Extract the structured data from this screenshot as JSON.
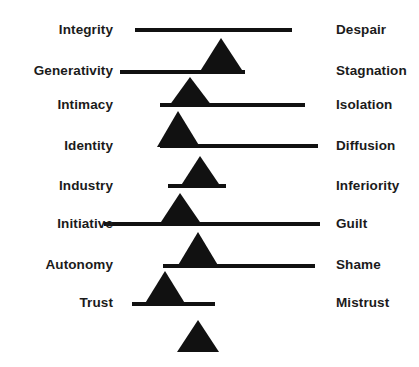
{
  "figure": {
    "background_color": "#ffffff",
    "ink_color": "#111111"
  },
  "rows": [
    {
      "left_label": "Integrity",
      "right_label": "Despair",
      "label_y": 30,
      "beam": {
        "x1": 135,
        "x2": 292,
        "y": 30,
        "thickness": 4
      },
      "fulcrum": null
    },
    {
      "left_label": "Generativity",
      "right_label": "Stagnation",
      "label_y": 71,
      "beam": {
        "x1": 120,
        "x2": 245,
        "y": 72,
        "thickness": 4
      },
      "fulcrum": {
        "apex_x": 221,
        "base_left": 199,
        "base_right": 244,
        "apex_y": 38,
        "base_y": 73
      }
    },
    {
      "left_label": "Intimacy",
      "right_label": "Isolation",
      "label_y": 105,
      "beam": {
        "x1": 160,
        "x2": 305,
        "y": 105,
        "thickness": 4
      },
      "fulcrum": {
        "apex_x": 190,
        "base_left": 169,
        "base_right": 212,
        "apex_y": 77,
        "base_y": 106
      }
    },
    {
      "left_label": "Identity",
      "right_label": "Diffusion",
      "label_y": 146,
      "beam": {
        "x1": 160,
        "x2": 318,
        "y": 146,
        "thickness": 4
      },
      "fulcrum": {
        "apex_x": 178,
        "base_left": 157,
        "base_right": 200,
        "apex_y": 111,
        "base_y": 147
      }
    },
    {
      "left_label": "Industry",
      "right_label": "Inferiority",
      "label_y": 186,
      "beam": {
        "x1": 168,
        "x2": 226,
        "y": 186,
        "thickness": 4
      },
      "fulcrum": {
        "apex_x": 200,
        "base_left": 180,
        "base_right": 221,
        "apex_y": 156,
        "base_y": 187
      }
    },
    {
      "left_label": "Initiative",
      "right_label": "Guilt",
      "label_y": 224,
      "beam": {
        "x1": 104,
        "x2": 320,
        "y": 224,
        "thickness": 4
      },
      "fulcrum": {
        "apex_x": 180,
        "base_left": 159,
        "base_right": 202,
        "apex_y": 193,
        "base_y": 225
      }
    },
    {
      "left_label": "Autonomy",
      "right_label": "Shame",
      "label_y": 265,
      "beam": {
        "x1": 163,
        "x2": 315,
        "y": 266,
        "thickness": 4
      },
      "fulcrum": {
        "apex_x": 198,
        "base_left": 177,
        "base_right": 219,
        "apex_y": 232,
        "base_y": 267
      }
    },
    {
      "left_label": "Trust",
      "right_label": "Mistrust",
      "label_y": 303,
      "beam": {
        "x1": 132,
        "x2": 215,
        "y": 304,
        "thickness": 4
      },
      "fulcrum": {
        "apex_x": 165,
        "base_left": 144,
        "base_right": 186,
        "apex_y": 271,
        "base_y": 305
      }
    }
  ],
  "bottom_fulcrum": {
    "apex_x": 198,
    "base_left": 177,
    "base_right": 219,
    "apex_y": 320,
    "base_y": 352
  },
  "chart_data": {
    "type": "diagram",
    "pairs": [
      {
        "positive": "Integrity",
        "negative": "Despair"
      },
      {
        "positive": "Generativity",
        "negative": "Stagnation"
      },
      {
        "positive": "Intimacy",
        "negative": "Isolation"
      },
      {
        "positive": "Identity",
        "negative": "Diffusion"
      },
      {
        "positive": "Industry",
        "negative": "Inferiority"
      },
      {
        "positive": "Initiative",
        "negative": "Guilt"
      },
      {
        "positive": "Autonomy",
        "negative": "Shame"
      },
      {
        "positive": "Trust",
        "negative": "Mistrust"
      }
    ]
  }
}
